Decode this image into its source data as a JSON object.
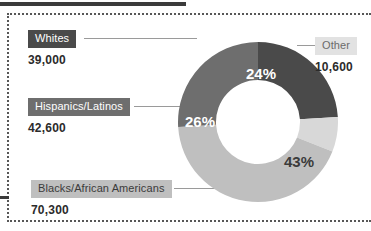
{
  "chart_data": {
    "type": "pie",
    "variant": "donut",
    "title": "",
    "categories": [
      "Whites",
      "Other",
      "Blacks/African Americans",
      "Hispanics/Latinos"
    ],
    "values": [
      24,
      7,
      43,
      26
    ],
    "value_unit": "%",
    "counts": [
      39000,
      10600,
      70300,
      42600
    ],
    "count_labels": [
      "39,000",
      "10,600",
      "70,300",
      "42,600"
    ],
    "percent_labels": [
      "24%",
      "7%",
      "43%",
      "26%"
    ],
    "colors": [
      "#4a4a4a",
      "#d8d8d8",
      "#bfbfbf",
      "#6e6e6e"
    ],
    "start_angle_deg": 0,
    "direction": "clockwise",
    "legend": "callout-labels",
    "grid": false
  },
  "slices": [
    {
      "id": "whites",
      "label": "Whites",
      "percent": "24%",
      "count": "39,000",
      "color": "#4a4a4a",
      "chip_style": "chip-dark",
      "pct_text_color": "#ffffff"
    },
    {
      "id": "other",
      "label": "Other",
      "percent": "7%",
      "count": "10,600",
      "color": "#d8d8d8",
      "chip_style": "chip-lighter",
      "pct_text_color": "#4a4a4a"
    },
    {
      "id": "blacks",
      "label": "Blacks/African Americans",
      "percent": "43%",
      "count": "70,300",
      "color": "#bfbfbf",
      "chip_style": "chip-light",
      "pct_text_color": "#3b3b3b"
    },
    {
      "id": "hispanics",
      "label": "Hispanics/Latinos",
      "percent": "26%",
      "count": "42,600",
      "color": "#6e6e6e",
      "chip_style": "chip-med",
      "pct_text_color": "#ffffff"
    }
  ],
  "theme": {
    "background": "#ffffff",
    "rule_color": "#3b3b3b",
    "frame_color": "#575757",
    "leader_color": "#9a9a9a",
    "value_text_color": "#2b2b2b"
  }
}
